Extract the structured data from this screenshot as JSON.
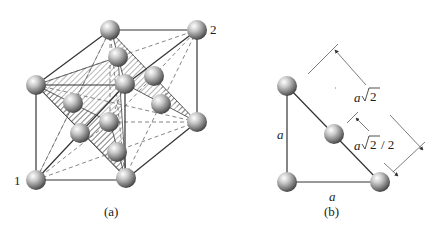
{
  "figure_a": {
    "caption": "(a)",
    "corner_label_1": "1",
    "corner_label_2": "2",
    "description": "Face-centered cubic unit cell with shaded close-packed (111) plane"
  },
  "figure_b": {
    "caption": "(b)",
    "side_vertical": "a",
    "side_horizontal": "a",
    "diagonal_full_prefix": "a",
    "diagonal_full_root": "2",
    "diagonal_half_prefix": "a",
    "diagonal_half_root": "2",
    "diagonal_half_suffix": "/ 2"
  },
  "colors": {
    "line": "#333333",
    "dashed": "#555555",
    "hatch": "#666666",
    "sphere_light": "#f2f2f2",
    "sphere_dark": "#3a3a3a"
  }
}
